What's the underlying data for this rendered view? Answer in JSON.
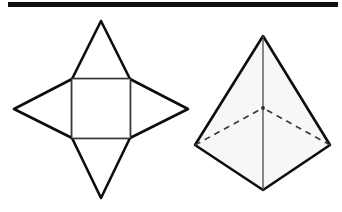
{
  "page": {
    "background_color": "#ffffff",
    "width": 342,
    "height": 212
  },
  "rule": {
    "name": "top-horizontal-rule",
    "color": "#101010",
    "x": 8,
    "y": 2,
    "width": 330,
    "height": 5
  },
  "chart_data": {
    "type": "diagram",
    "figures": [
      {
        "id": "net",
        "label": "Net of a square pyramid",
        "description": "Central square base with four congruent triangular lateral faces folded outward, forming a four-pointed star.",
        "base": {
          "shape": "square",
          "stroke_color": "#5f5f5f",
          "stroke_width": 1.1,
          "fill": "#ffffff",
          "points": [
            [
              72,
              79
            ],
            [
              130,
              79
            ],
            [
              130,
              138
            ],
            [
              72,
              138
            ]
          ]
        },
        "flaps": [
          {
            "name": "top-triangle",
            "apex": [
              101,
              21
            ],
            "points": [
              [
                72,
                79
              ],
              [
                130,
                79
              ],
              [
                101,
                21
              ]
            ]
          },
          {
            "name": "right-triangle",
            "apex": [
              188,
              109
            ],
            "points": [
              [
                130,
                79
              ],
              [
                130,
                138
              ],
              [
                188,
                109
              ]
            ]
          },
          {
            "name": "bottom-triangle",
            "apex": [
              101,
              198
            ],
            "points": [
              [
                72,
                138
              ],
              [
                130,
                138
              ],
              [
                101,
                198
              ]
            ]
          },
          {
            "name": "left-triangle",
            "apex": [
              14,
              109
            ],
            "points": [
              [
                72,
                79
              ],
              [
                72,
                138
              ],
              [
                14,
                109
              ]
            ]
          }
        ],
        "flap_stroke_color": "#0d0d0d",
        "flap_stroke_width": 2.6,
        "flap_fill": "#ffffff"
      },
      {
        "id": "solid",
        "label": "Square pyramid solid",
        "description": "Square pyramid drawn in corner-on perspective with two visible lateral faces, a vertical front edge, and dashed hidden base edges meeting at the rear base vertex.",
        "apex": [
          263,
          36
        ],
        "base_vertices": {
          "left": [
            195,
            145
          ],
          "right": [
            330,
            145
          ],
          "front": [
            263,
            190
          ],
          "back_hidden": [
            263,
            108
          ]
        },
        "visible_outline": [
          [
            263,
            36
          ],
          [
            330,
            145
          ],
          [
            263,
            190
          ],
          [
            195,
            145
          ]
        ],
        "face_fill": "#f6f7f7",
        "outline_stroke_color": "#0d0d0d",
        "outline_stroke_width": 2.6,
        "front_edge": {
          "from": [
            263,
            36
          ],
          "to": [
            263,
            190
          ],
          "color": "#4a4a4a",
          "width": 1.3
        },
        "hidden_edges": [
          {
            "from": [
              195,
              145
            ],
            "to": [
              263,
              108
            ]
          },
          {
            "from": [
              330,
              145
            ],
            "to": [
              263,
              108
            ]
          }
        ],
        "hidden_stroke_color": "#3c3c3c",
        "hidden_stroke_width": 1.7,
        "hidden_dash_pattern": "6 5"
      }
    ]
  }
}
